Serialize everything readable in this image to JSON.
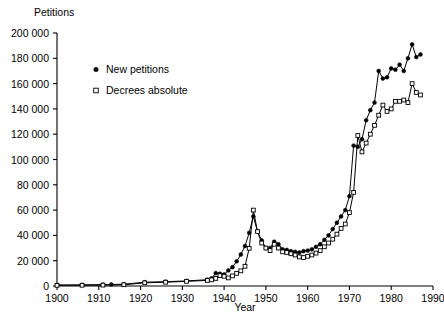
{
  "chart_data": {
    "type": "line",
    "title": "",
    "ylabel": "Petitions",
    "xlabel": "Year",
    "xlim": [
      1900,
      1990
    ],
    "ylim": [
      0,
      200000
    ],
    "grid": false,
    "legend_position": "upper-left-inside",
    "xticks": [
      1900,
      1910,
      1920,
      1930,
      1940,
      1950,
      1960,
      1970,
      1980,
      1990
    ],
    "xtick_labels": [
      "1900",
      "1910",
      "1920",
      "1930",
      "1940",
      "1950",
      "1960",
      "1970",
      "1980",
      "1990"
    ],
    "yticks": [
      0,
      20000,
      40000,
      60000,
      80000,
      100000,
      120000,
      140000,
      160000,
      180000,
      200000
    ],
    "ytick_labels": [
      "0",
      "20 000",
      "40 000",
      "60 000",
      "80 000",
      "100 000",
      "120 000",
      "140 000",
      "160 000",
      "180 000",
      "200 000"
    ],
    "series": [
      {
        "name": "New petitions",
        "marker": "filled-circle",
        "x": [
          1900,
          1906,
          1911,
          1913,
          1916,
          1921,
          1926,
          1931,
          1936,
          1937,
          1938,
          1939,
          1940,
          1941,
          1942,
          1943,
          1944,
          1945,
          1946,
          1947,
          1948,
          1949,
          1950,
          1951,
          1952,
          1953,
          1954,
          1955,
          1956,
          1957,
          1958,
          1959,
          1960,
          1961,
          1962,
          1963,
          1964,
          1965,
          1966,
          1967,
          1968,
          1969,
          1970,
          1971,
          1972,
          1973,
          1974,
          1975,
          1976,
          1977,
          1978,
          1979,
          1980,
          1981,
          1982,
          1983,
          1984,
          1985,
          1986,
          1987
        ],
        "y": [
          800,
          900,
          1100,
          1200,
          1400,
          3000,
          3400,
          4000,
          5000,
          6000,
          10200,
          9700,
          9100,
          12300,
          14900,
          19500,
          24900,
          31600,
          42000,
          55000,
          43000,
          36000,
          30000,
          30000,
          35000,
          33000,
          29000,
          28500,
          27500,
          27000,
          26500,
          27500,
          28000,
          29000,
          31000,
          33000,
          36500,
          40000,
          45000,
          50000,
          55000,
          60000,
          71000,
          111000,
          110000,
          116000,
          131000,
          139000,
          145000,
          170000,
          164000,
          165000,
          172000,
          171000,
          175000,
          170000,
          180000,
          191000,
          181000,
          183000
        ],
        "peaks": {
          "1947": 55000,
          "1971": 111000,
          "1985": 191000
        }
      },
      {
        "name": "Decrees absolute",
        "marker": "open-square",
        "x": [
          1900,
          1906,
          1911,
          1916,
          1921,
          1926,
          1931,
          1936,
          1937,
          1938,
          1939,
          1940,
          1941,
          1942,
          1943,
          1944,
          1945,
          1946,
          1947,
          1948,
          1949,
          1950,
          1951,
          1952,
          1953,
          1954,
          1955,
          1956,
          1957,
          1958,
          1959,
          1960,
          1961,
          1962,
          1963,
          1964,
          1965,
          1966,
          1967,
          1968,
          1969,
          1970,
          1971,
          1972,
          1973,
          1974,
          1975,
          1976,
          1977,
          1978,
          1979,
          1980,
          1981,
          1982,
          1983,
          1984,
          1985,
          1986,
          1987
        ],
        "y": [
          500,
          600,
          700,
          1000,
          2500,
          3000,
          3700,
          4400,
          4900,
          6000,
          8200,
          7700,
          6400,
          8000,
          10000,
          12000,
          15600,
          29800,
          60000,
          43000,
          34000,
          30000,
          28000,
          33000,
          30000,
          27000,
          26500,
          25500,
          24500,
          23000,
          22500,
          23500,
          24500,
          26000,
          28000,
          31000,
          34000,
          37000,
          41000,
          45500,
          49000,
          58000,
          74000,
          119000,
          106000,
          113000,
          120000,
          127000,
          135000,
          143000,
          138000,
          140000,
          146000,
          146000,
          147000,
          145000,
          160000,
          153000,
          151000
        ]
      }
    ],
    "legend": [
      {
        "label": "New petitions",
        "marker": "filled-circle"
      },
      {
        "label": "Decrees absolute",
        "marker": "open-square"
      }
    ]
  }
}
